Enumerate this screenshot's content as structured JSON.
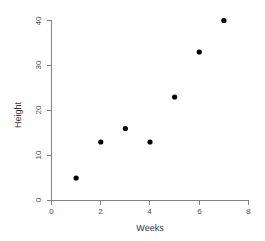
{
  "chart_data": {
    "type": "scatter",
    "title": "",
    "xlabel": "Weeks",
    "ylabel": "Height",
    "x": [
      1,
      2,
      3,
      4,
      5,
      6,
      7
    ],
    "values": [
      5,
      13,
      16,
      13,
      23,
      33,
      40
    ],
    "points": [
      {
        "x": 1,
        "y": 5
      },
      {
        "x": 2,
        "y": 13
      },
      {
        "x": 3,
        "y": 16
      },
      {
        "x": 4,
        "y": 13
      },
      {
        "x": 5,
        "y": 23
      },
      {
        "x": 6,
        "y": 33
      },
      {
        "x": 7,
        "y": 40
      }
    ],
    "xlim": [
      0,
      8
    ],
    "ylim": [
      0,
      40
    ],
    "xticks": [
      0,
      2,
      4,
      6,
      8
    ],
    "yticks": [
      0,
      10,
      20,
      30,
      40
    ],
    "xtick_labels": [
      "0",
      "2",
      "4",
      "6",
      "8"
    ],
    "ytick_labels": [
      "0",
      "10",
      "20",
      "30",
      "40"
    ],
    "grid": false,
    "legend": null,
    "marker": "filled-circle",
    "marker_color": "#000000",
    "axis_color": "#808080"
  },
  "axes": {
    "x_title": "Weeks",
    "y_title": "Height"
  },
  "ticks": {
    "x": [
      {
        "label": "0",
        "value": 0
      },
      {
        "label": "2",
        "value": 2
      },
      {
        "label": "4",
        "value": 4
      },
      {
        "label": "6",
        "value": 6
      },
      {
        "label": "8",
        "value": 8
      }
    ],
    "y": [
      {
        "label": "0",
        "value": 0
      },
      {
        "label": "10",
        "value": 10
      },
      {
        "label": "20",
        "value": 20
      },
      {
        "label": "30",
        "value": 30
      },
      {
        "label": "40",
        "value": 40
      }
    ]
  }
}
